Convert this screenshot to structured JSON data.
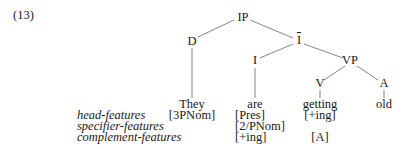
{
  "example_number": "(13)",
  "tree": {
    "root": "IP",
    "nodes": {
      "IP": "IP",
      "D": "D",
      "Ibar": "I",
      "I": "I",
      "VP": "VP",
      "V": "V",
      "A": "A"
    },
    "leaves": {
      "D": {
        "word": "They",
        "features": [
          "[3PNom]"
        ]
      },
      "I": {
        "word": "are",
        "features": [
          "[Pres]",
          "[2/PNom]",
          "[+ing]"
        ]
      },
      "V": {
        "word": "getting",
        "features": [
          "[+ing]",
          "",
          "[A]"
        ]
      },
      "A": {
        "word": "old",
        "features": []
      }
    }
  },
  "feature_labels": [
    "head-features",
    "specifier-features",
    "complement-features"
  ],
  "colors": {
    "text": "#1a1a1a",
    "lines": "#555555",
    "background": "#ffffff"
  }
}
